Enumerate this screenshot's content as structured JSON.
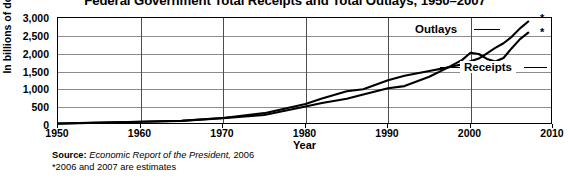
{
  "chart_data": {
    "type": "line",
    "title": "Federal Government Total Receipts and Total Outlays, 1950–2007",
    "xlabel": "Year",
    "ylabel": "In billions of dollars",
    "xlim": [
      1950,
      2010
    ],
    "ylim": [
      0,
      3000
    ],
    "grid": true,
    "legend_position": "inline-labels",
    "xticks": [
      "1950",
      "1960",
      "1970",
      "1980",
      "1990",
      "2000",
      "2010"
    ],
    "xtick_values": [
      1950,
      1960,
      1970,
      1980,
      1990,
      2000,
      2010
    ],
    "yticks": [
      "0",
      "500",
      "1,000",
      "1,500",
      "2,000",
      "2,500",
      "3,000"
    ],
    "ytick_values": [
      0,
      500,
      1000,
      1500,
      2000,
      2500,
      3000
    ],
    "series": [
      {
        "name": "Outlays",
        "label": "Outlays",
        "color": "#000000",
        "x": [
          1950,
          1955,
          1960,
          1965,
          1970,
          1975,
          1980,
          1982,
          1985,
          1987,
          1990,
          1992,
          1995,
          1997,
          1999,
          2000,
          2001,
          2002,
          2003,
          2004,
          2005,
          2006,
          2007
        ],
        "values": [
          43,
          68,
          92,
          118,
          196,
          332,
          591,
          746,
          946,
          1004,
          1253,
          1382,
          1516,
          1601,
          1702,
          1789,
          1863,
          2011,
          2160,
          2293,
          2472,
          2709,
          2902
        ]
      },
      {
        "name": "Receipts",
        "label": "Receipts",
        "color": "#000000",
        "x": [
          1950,
          1955,
          1960,
          1965,
          1970,
          1975,
          1980,
          1982,
          1985,
          1987,
          1990,
          1992,
          1995,
          1997,
          1999,
          2000,
          2001,
          2002,
          2003,
          2004,
          2005,
          2006,
          2007
        ],
        "values": [
          39,
          65,
          92,
          117,
          193,
          279,
          517,
          618,
          734,
          854,
          1032,
          1091,
          1352,
          1579,
          1827,
          2025,
          1991,
          1853,
          1782,
          1880,
          2154,
          2407,
          2590
        ]
      }
    ],
    "annotations": [
      {
        "name": "outlays-estimate-marker",
        "text": "*",
        "year": 2007,
        "series": "Outlays"
      },
      {
        "name": "receipts-estimate-marker",
        "text": "*",
        "year": 2007,
        "series": "Receipts"
      }
    ]
  },
  "footnotes": {
    "source_label": "Source:",
    "source_publication": "Economic Report of the President,",
    "source_year": "2006",
    "estimates_note": "*2006 and 2007 are estimates"
  }
}
